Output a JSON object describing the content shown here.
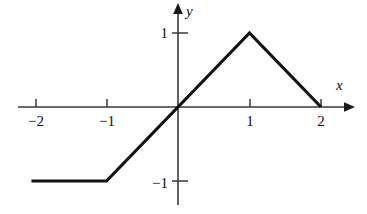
{
  "figure": {
    "background_color": "#ffffff",
    "ink_color": "#111111",
    "axis_color": "#3a3a3a"
  },
  "axes": {
    "x_axis_label": "x",
    "y_axis_label": "y",
    "x_ticks": [
      {
        "value": -2,
        "label": "−2"
      },
      {
        "value": -1,
        "label": "−1"
      },
      {
        "value": 1,
        "label": "1"
      },
      {
        "value": 2,
        "label": "2"
      }
    ],
    "y_ticks": [
      {
        "value": 1,
        "label": "1"
      },
      {
        "value": -1,
        "label": "−1"
      }
    ]
  },
  "chart_data": {
    "type": "line",
    "title": "",
    "xlabel": "x",
    "ylabel": "y",
    "xlim": [
      -2.24,
      2.4
    ],
    "ylim": [
      -1.45,
      1.35
    ],
    "grid": false,
    "legend": false,
    "series": [
      {
        "name": "piecewise-linear graph",
        "x": [
          -2.05,
          -1,
          0,
          1,
          2
        ],
        "y": [
          -1,
          -1,
          0,
          1,
          0
        ]
      }
    ],
    "annotations": [
      {
        "label": "constant segment",
        "x_start": -2.05,
        "x_end": -1,
        "y": -1
      },
      {
        "label": "rising segment slope 1",
        "x_start": -1,
        "x_end": 1
      },
      {
        "label": "peak",
        "x": 1,
        "y": 1
      },
      {
        "label": "falling segment slope -1",
        "x_start": 1,
        "x_end": 2
      },
      {
        "label": "x-intercept",
        "x": 2,
        "y": 0
      },
      {
        "label": "origin crossing",
        "x": 0,
        "y": 0
      }
    ]
  }
}
